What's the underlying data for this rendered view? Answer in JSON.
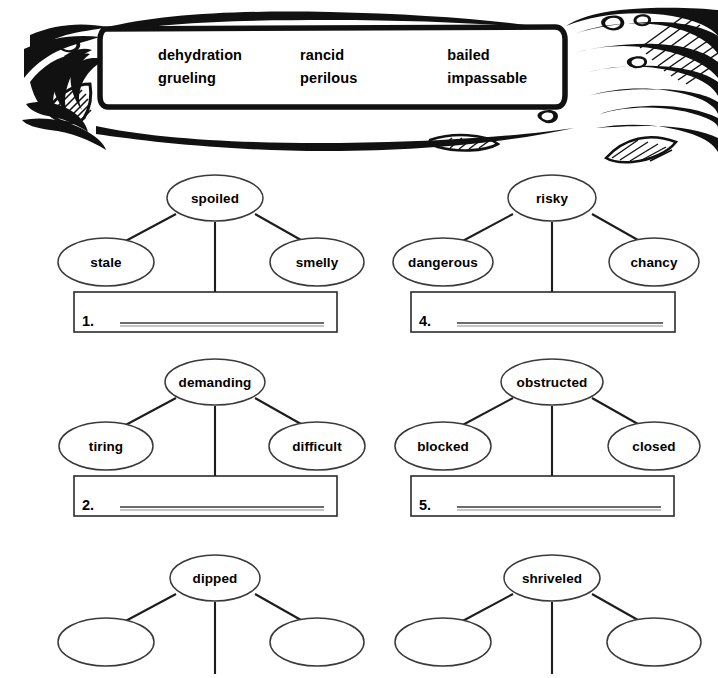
{
  "word_bank": {
    "name": "word-bank",
    "columns": [
      {
        "words": [
          "dehydration",
          "grueling"
        ]
      },
      {
        "words": [
          "rancid",
          "perilous"
        ]
      },
      {
        "words": [
          "bailed",
          "impassable"
        ]
      }
    ],
    "artwork": "water-splash-illustration"
  },
  "webs": [
    {
      "number": "1.",
      "center": "spoiled",
      "left": "stale",
      "right": "smelly",
      "answer_value": ""
    },
    {
      "number": "4.",
      "center": "risky",
      "left": "dangerous",
      "right": "chancy",
      "answer_value": ""
    },
    {
      "number": "2.",
      "center": "demanding",
      "left": "tiring",
      "right": "difficult",
      "answer_value": ""
    },
    {
      "number": "5.",
      "center": "obstructed",
      "left": "blocked",
      "right": "closed",
      "answer_value": ""
    },
    {
      "number": "3.",
      "center": "dipped",
      "left": "",
      "right": "",
      "answer_value": ""
    },
    {
      "number": "6.",
      "center": "shriveled",
      "left": "",
      "right": "",
      "answer_value": ""
    }
  ],
  "colors": {
    "ink": "#000000",
    "oval_stroke": "#3a3a3a",
    "rule": "#555555",
    "page": "#ffffff"
  }
}
